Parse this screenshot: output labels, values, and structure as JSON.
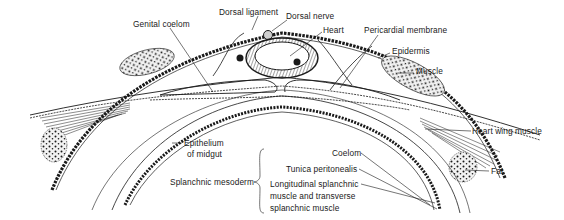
{
  "figure": {
    "colors": {
      "ink": "#1a1a1a",
      "background": "#ffffff",
      "heart_wall": "#6a6a6a"
    }
  },
  "labels": {
    "dorsal_ligament": "Dorsal ligament",
    "dorsal_nerve": "Dorsal nerve",
    "genital_coelom": "Genital coelom",
    "heart": "Heart",
    "pericardial_membrane": "Pericardial membrane",
    "epidermis": "Epidermis",
    "muscle": "Muscle",
    "heart_wing_muscle": "Heart wing muscle",
    "fat": "Fat",
    "epithelium_line1": "Epithelium",
    "epithelium_line2": "of midgut",
    "coelom": "Coelom",
    "tunica_peritonealis": "Tunica peritonealis",
    "splanchnic_mesoderm": "Splanchnic mesoderm",
    "longitudinal_line1": "Longitudinal splanchnic",
    "longitudinal_line2": "muscle and transverse",
    "longitudinal_line3": "splanchnic muscle"
  }
}
